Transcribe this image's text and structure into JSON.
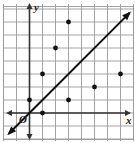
{
  "chart_data": {
    "type": "scatter",
    "title": "",
    "xlabel": "x",
    "ylabel": "y",
    "origin_label": "O",
    "grid": true,
    "xlim": [
      -2,
      8
    ],
    "ylim": [
      -2,
      8
    ],
    "points": [
      {
        "x": 3,
        "y": 7
      },
      {
        "x": 2,
        "y": 5
      },
      {
        "x": 1,
        "y": 3
      },
      {
        "x": 7,
        "y": 3
      },
      {
        "x": 5,
        "y": 2
      },
      {
        "x": 3,
        "y": 1
      },
      {
        "x": 0,
        "y": 1
      },
      {
        "x": 1,
        "y": 0
      }
    ],
    "lines": [
      {
        "name": "y = x",
        "slope": 1,
        "intercept": 0,
        "arrows": "both"
      }
    ]
  },
  "colors": {
    "grid": "#9a9a9a",
    "axis": "#333333",
    "point": "#111111",
    "line": "#111111"
  },
  "labels": {
    "x_axis": "x",
    "y_axis": "y",
    "origin": "O"
  }
}
